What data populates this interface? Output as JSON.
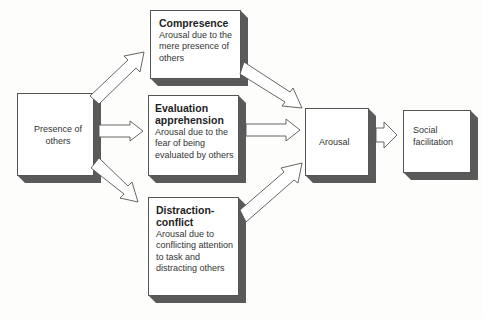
{
  "diagram": {
    "nodes": {
      "presence": {
        "label": "Presence of others"
      },
      "compresence": {
        "title": "Compresence",
        "description": "Arousal due to the mere presence of others"
      },
      "evaluation": {
        "title": "Evaluation apprehension",
        "description": "Arousal due to the fear of being evaluated by others"
      },
      "distraction": {
        "title": "Distraction-conflict",
        "description": "Arousal due to conflicting attention to task and distracting others"
      },
      "arousal": {
        "label": "Arousal"
      },
      "social_facilitation": {
        "label": "Social facilitation"
      }
    },
    "edges": [
      {
        "from": "presence",
        "to": "compresence"
      },
      {
        "from": "presence",
        "to": "evaluation"
      },
      {
        "from": "presence",
        "to": "distraction"
      },
      {
        "from": "compresence",
        "to": "arousal"
      },
      {
        "from": "evaluation",
        "to": "arousal"
      },
      {
        "from": "distraction",
        "to": "arousal"
      },
      {
        "from": "arousal",
        "to": "social_facilitation"
      }
    ],
    "colors": {
      "box_fill": "#ffffff",
      "box_depth": "#5a5a5a",
      "arrow_fill": "#ffffff",
      "arrow_stroke": "#555555",
      "background": "#fdfdfc"
    }
  }
}
